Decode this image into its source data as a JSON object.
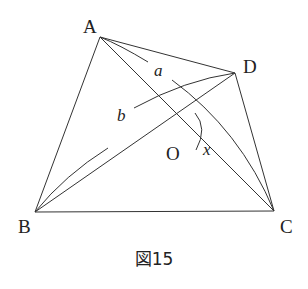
{
  "figure": {
    "caption": "図15",
    "vertices": {
      "A": {
        "label": "A",
        "x": 100,
        "y": 37
      },
      "B": {
        "label": "B",
        "x": 35,
        "y": 212
      },
      "C": {
        "label": "C",
        "x": 274,
        "y": 211
      },
      "D": {
        "label": "D",
        "x": 235,
        "y": 73
      },
      "O": {
        "label": "O",
        "x": 178,
        "y": 133
      }
    },
    "segments": [
      "AB",
      "AD",
      "DC",
      "BC",
      "AC",
      "BD"
    ],
    "arcs": [
      {
        "from": "A",
        "to": "C",
        "label": "a"
      },
      {
        "from": "B",
        "to": "D",
        "label": "b"
      }
    ],
    "angle": {
      "at": "O",
      "label": "x"
    },
    "labels": {
      "A": "A",
      "B": "B",
      "C": "C",
      "D": "D",
      "O": "O",
      "a": "a",
      "b": "b",
      "x": "x"
    }
  }
}
